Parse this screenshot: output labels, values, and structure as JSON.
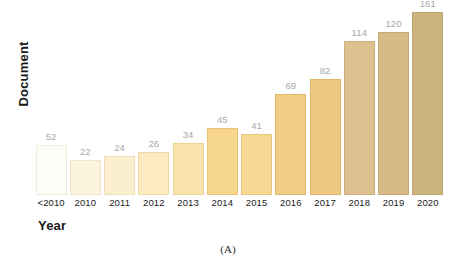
{
  "chart_data": {
    "type": "bar",
    "title": "",
    "subtitle": "",
    "xlabel": "Year",
    "ylabel": "Document",
    "caption": "(A)",
    "categories": [
      "<2010",
      "2010",
      "2011",
      "2012",
      "2013",
      "2014",
      "2015",
      "2016",
      "2017",
      "2018",
      "2019",
      "2020"
    ],
    "values": [
      52,
      22,
      24,
      26,
      34,
      45,
      41,
      69,
      82,
      114,
      120,
      161
    ],
    "value_labels": [
      "52",
      "22",
      "24",
      "26",
      "34",
      "45",
      "41",
      "69",
      "82",
      "114",
      "120",
      "161"
    ],
    "bar_colors": [
      "#fefdfa",
      "#fdf4df",
      "#fcefd0",
      "#fbeac2",
      "#f9e3ad",
      "#f7d68d",
      "#f6d892",
      "#f0cd86",
      "#eec981",
      "#ddc18e",
      "#d6bb87",
      "#cdb37e"
    ],
    "bar_border_colors": [
      "#f0ead8",
      "#f2e6c6",
      "#f0dfb6",
      "#eed9a8",
      "#ecd295",
      "#e9c478",
      "#e8c67d",
      "#e2bb71",
      "#dfb76c",
      "#ccb07b",
      "#c5aa74",
      "#bca26c"
    ],
    "bar_pixel_heights": [
      50,
      35,
      39,
      43,
      52,
      67,
      61,
      101,
      116,
      154,
      163,
      183
    ],
    "legend": [],
    "grid": false,
    "axis_line": false,
    "ylim": [
      0,
      161
    ],
    "label_color": "#a9a9a9",
    "axis_text_color": "#1a1a1a",
    "background": "#ffffff"
  }
}
